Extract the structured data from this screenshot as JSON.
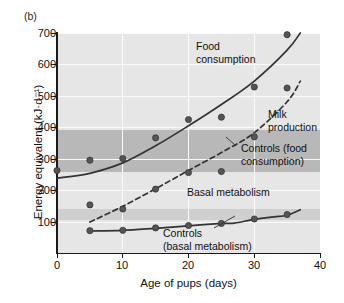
{
  "figure": {
    "panel_label": "(b)"
  },
  "chart_data": {
    "type": "scatter",
    "title": "",
    "xlabel": "Age of pups (days)",
    "ylabel": "Energy equivalent (kJ·d⁻¹)",
    "xlim": [
      0,
      40
    ],
    "ylim": [
      60,
      700
    ],
    "xticks": [
      0,
      10,
      20,
      30,
      40
    ],
    "xticklabels": [
      "0",
      "10",
      "20",
      "30",
      "40"
    ],
    "yticks": [
      100,
      200,
      300,
      400,
      500,
      600,
      700
    ],
    "yticklabels": [
      "100",
      "200",
      "300",
      "400",
      "500",
      "600",
      "700"
    ],
    "grid": "white gridlines on gray plot background",
    "legend": "inline annotations, no legend box",
    "series": [
      {
        "name": "Food consumption",
        "style": "solid line with filled circle markers",
        "x": [
          0,
          5,
          10,
          15,
          20,
          25,
          30,
          35
        ],
        "y": [
          300,
          330,
          335,
          395,
          448,
          455,
          543,
          695
        ]
      },
      {
        "name": "Milk production",
        "style": "dashed line with filled circle markers",
        "x": [
          5,
          10,
          15,
          20,
          25,
          30,
          35
        ],
        "y": [
          200,
          188,
          246,
          294,
          297,
          398,
          540
        ]
      },
      {
        "name": "Basal metabolism",
        "style": "solid line with filled circle markers",
        "x": [
          5,
          10,
          15,
          20,
          25,
          30,
          35
        ],
        "y": [
          125,
          126,
          133,
          140,
          146,
          159,
          172
        ]
      }
    ],
    "bands": [
      {
        "name": "Controls (food consumption)",
        "range": [
          270,
          380
        ],
        "color": "#b8b8b8"
      },
      {
        "name": "Controls (basal metabolism)",
        "range": [
          120,
          146
        ],
        "color": "#cfcfcf"
      }
    ],
    "annotations": [
      {
        "name": "food-consumption",
        "text": "Food\nconsumption"
      },
      {
        "name": "milk-production",
        "text": "Milk\nproduction"
      },
      {
        "name": "controls-food-consumption",
        "text": "Controls (food\nconsumption)"
      },
      {
        "name": "basal-metabolism",
        "text": "Basal metabolism"
      },
      {
        "name": "controls-basal-metabolism",
        "text": "Controls\n(basal metabolism)"
      }
    ],
    "colors": {
      "plot_background": "#e6e6e6",
      "band_food": "#b8b8b8",
      "band_basal": "#cfcfcf",
      "gridline": "#fafafa",
      "line": "#333333",
      "marker": "#555555",
      "axis": "#1a1a1a"
    }
  }
}
